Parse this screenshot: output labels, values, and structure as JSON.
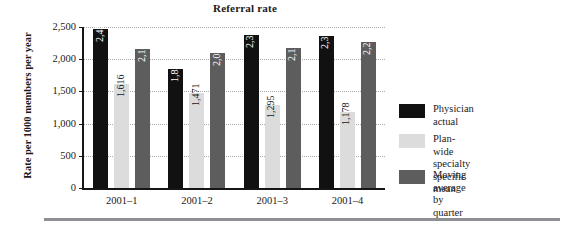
{
  "chart_data": {
    "type": "bar",
    "title": "Referral rate",
    "xlabel": "",
    "ylabel": "Rate per 1000 members per year",
    "categories": [
      "2001–1",
      "2001–2",
      "2001–3",
      "2001–4"
    ],
    "series": [
      {
        "name": "Physician actual",
        "color": "#111111",
        "values": [
          2465,
          1844,
          2373,
          2355
        ],
        "labels": [
          "2,465",
          "1,844",
          "2,373",
          "2,355"
        ]
      },
      {
        "name": "Plan-wide specialty specific mean",
        "color": "#dcdcdc",
        "values": [
          1616,
          1471,
          1295,
          1178
        ],
        "labels": [
          "1,616",
          "1,471",
          "1,295",
          "1,178"
        ]
      },
      {
        "name": "Moving average by quarter",
        "color": "#5d5d5d",
        "values": [
          2163,
          2089,
          2174,
          2263
        ],
        "labels": [
          "2,163",
          "2,089",
          "2,174",
          "2,263"
        ]
      }
    ],
    "ylim": [
      0,
      2500
    ],
    "yticks": [
      0,
      500,
      1000,
      1500,
      2000,
      2500
    ],
    "ytick_labels": [
      "0",
      "500",
      "1,000",
      "1,500",
      "2,000",
      "2,500"
    ],
    "grid": true,
    "legend_position": "right"
  },
  "legend": {
    "entries": [
      {
        "label": "Physician actual"
      },
      {
        "label": "Plan-wide specialty\nspecific mean"
      },
      {
        "label": "Moving average\nby quarter"
      }
    ]
  }
}
